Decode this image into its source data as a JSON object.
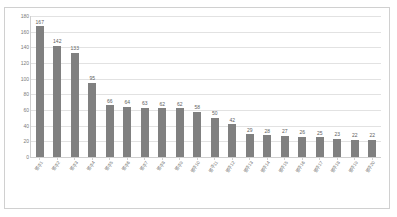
{
  "chart_data": {
    "type": "bar",
    "title": "",
    "xlabel": "",
    "ylabel": "",
    "ylim": [
      0,
      180
    ],
    "y_ticks": [
      0,
      20,
      40,
      60,
      80,
      100,
      120,
      140,
      160,
      180
    ],
    "grid": true,
    "legend": "none",
    "bar_color": "#808080",
    "categories": [
      "범주1",
      "범주2",
      "범주3",
      "범주4",
      "범주5",
      "범주6",
      "범주7",
      "범주8",
      "범주9",
      "범주10",
      "범주11",
      "범주12",
      "범주13",
      "범주14",
      "범주15",
      "범주16",
      "범주17",
      "범주18",
      "범주19",
      "범주20"
    ],
    "values": [
      167,
      142,
      133,
      95,
      66,
      64,
      63,
      62,
      62,
      58,
      50,
      42,
      29,
      28,
      27,
      26,
      25,
      23,
      22,
      22
    ]
  }
}
